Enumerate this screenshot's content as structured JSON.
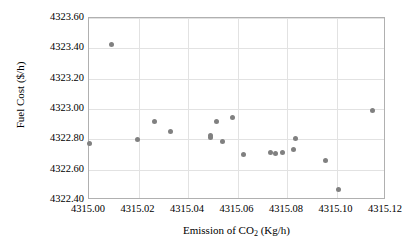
{
  "chart_data": {
    "type": "scatter",
    "title": "",
    "xlabel": "Emission of CO2 (Kg/h)",
    "xlabel_prefix": "Emission of CO",
    "xlabel_sub": "2",
    "xlabel_suffix": " (Kg/h)",
    "ylabel": "Fuel Cost ($/h)",
    "xlim": [
      4315.0,
      4315.12
    ],
    "ylim": [
      4322.4,
      4323.6
    ],
    "xticks": [
      "4315.00",
      "4315.02",
      "4315.04",
      "4315.06",
      "4315.08",
      "4315.10",
      "4315.12"
    ],
    "xtick_values": [
      4315.0,
      4315.02,
      4315.04,
      4315.06,
      4315.08,
      4315.1,
      4315.12
    ],
    "yticks": [
      "4322.40",
      "4322.60",
      "4322.80",
      "4323.00",
      "4323.20",
      "4323.40",
      "4323.60"
    ],
    "ytick_values": [
      4322.4,
      4322.6,
      4322.8,
      4323.0,
      4323.2,
      4323.4,
      4323.6
    ],
    "grid": true,
    "legend": false,
    "marker_color": "#808080",
    "marker_size": 5,
    "series": [
      {
        "name": "Pareto solutions",
        "points": [
          [
            4315.0,
            4322.77
          ],
          [
            4315.009,
            4323.425
          ],
          [
            4315.0195,
            4322.799
          ],
          [
            4315.0265,
            4322.918
          ],
          [
            4315.033,
            4322.852
          ],
          [
            4315.049,
            4322.823
          ],
          [
            4315.049,
            4322.809
          ],
          [
            4315.0515,
            4322.919
          ],
          [
            4315.054,
            4322.784
          ],
          [
            4315.058,
            4322.943
          ],
          [
            4315.0625,
            4322.703
          ],
          [
            4315.0735,
            4322.713
          ],
          [
            4315.0755,
            4322.707
          ],
          [
            4315.078,
            4322.71
          ],
          [
            4315.0825,
            4322.731
          ],
          [
            4315.0835,
            4322.806
          ],
          [
            4315.0955,
            4322.658
          ],
          [
            4315.101,
            4322.468
          ],
          [
            4315.1145,
            4322.992
          ]
        ]
      }
    ]
  },
  "axes_geometry": {
    "plot_left_px": 88,
    "plot_top_px": 17,
    "plot_width_px": 297,
    "plot_height_px": 182
  }
}
